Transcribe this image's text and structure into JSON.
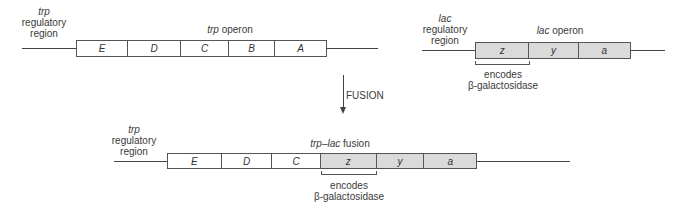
{
  "colors": {
    "line": "#444444",
    "trp_gene_fill": "#ffffff",
    "lac_gene_fill": "#dadada"
  },
  "top_trp": {
    "regulatory_label": {
      "italic": "trp",
      "line2": "regulatory",
      "line3": "region"
    },
    "operon_label": {
      "italic": "trp",
      "text": " operon"
    },
    "genes": [
      "E",
      "D",
      "C",
      "B",
      "A"
    ]
  },
  "top_lac": {
    "regulatory_label": {
      "italic": "lac",
      "line2": "regulatory",
      "line3": "region"
    },
    "operon_label": {
      "italic": "lac",
      "text": " operon"
    },
    "genes": [
      "z",
      "y",
      "a"
    ],
    "bracket_label": {
      "line1": "encodes",
      "line2": "β-galactosidase"
    }
  },
  "arrow": {
    "label": "FUSION"
  },
  "bottom_fusion": {
    "regulatory_label": {
      "italic": "trp",
      "line2": "regulatory",
      "line3": "region"
    },
    "fusion_label": {
      "italic": "trp–lac",
      "text": " fusion"
    },
    "trp_genes": [
      "E",
      "D",
      "C"
    ],
    "lac_genes": [
      "z",
      "y",
      "a"
    ],
    "bracket_label": {
      "line1": "encodes",
      "line2": "β-galactosidase"
    }
  }
}
